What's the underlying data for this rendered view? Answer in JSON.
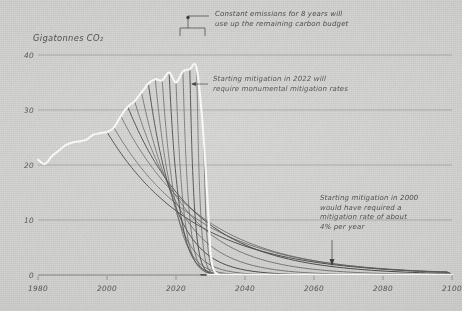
{
  "chart_data": {
    "type": "line",
    "title": "",
    "ylabel": "Gigatonnes CO₂",
    "xlabel": "",
    "xlim": [
      1980,
      2100
    ],
    "ylim": [
      0,
      44
    ],
    "grid": true,
    "legend_position": "none",
    "xticks": [
      1980,
      2000,
      2020,
      2040,
      2060,
      2080,
      2100
    ],
    "xtick_labels": [
      "1980",
      "2000",
      "2020",
      "2040",
      "2060",
      "2080",
      "2100"
    ],
    "yticks": [
      0,
      10,
      20,
      30,
      40
    ],
    "ytick_labels": [
      "0",
      "10",
      "20",
      "30",
      "40"
    ],
    "series": [
      {
        "name": "Historical emissions",
        "color": "#fdfdfb",
        "kind": "historical",
        "x": [
          1980,
          1982,
          1984,
          1986,
          1988,
          1990,
          1992,
          1994,
          1996,
          1998,
          2000,
          2002,
          2004,
          2006,
          2008,
          2010,
          2012,
          2014,
          2016,
          2018,
          2020,
          2022,
          2024,
          2026,
          2028,
          2030
        ],
        "values": [
          21.0,
          20.2,
          21.6,
          22.6,
          23.6,
          24.1,
          24.3,
          24.6,
          25.5,
          25.8,
          26.0,
          26.8,
          28.9,
          30.6,
          31.6,
          33.2,
          34.8,
          35.6,
          35.4,
          36.8,
          35.0,
          37.0,
          37.4,
          37.5,
          25.0,
          4.0
        ]
      },
      {
        "name": "Mitigation pathways fan",
        "color": "#5d5d5b",
        "kind": "fan",
        "start_years": [
          2000,
          2002,
          2004,
          2006,
          2008,
          2010,
          2012,
          2014,
          2016,
          2018,
          2020,
          2022,
          2024,
          2026,
          2028,
          2030
        ],
        "note": "Each curve branches from the historical emissions line at its start year and declines to near zero; later starts require steeper declines."
      }
    ],
    "annotations": [
      {
        "id": "constant-emissions",
        "lines": [
          "Constant emissions for 8 years will",
          "use up the remaining carbon budget"
        ],
        "target": "bracket spanning 2022–2030 at top of fan"
      },
      {
        "id": "mitigation-2022",
        "lines": [
          "Starting mitigation in 2022 will",
          "require monumental mitigation rates"
        ],
        "target": "steepest decline branch near 2030"
      },
      {
        "id": "mitigation-2000",
        "lines": [
          "Starting mitigation in 2000",
          "would have required a",
          "mitigation rate of about",
          "4% per year"
        ],
        "target": "shallowest decline branch near 2075"
      }
    ],
    "colors": {
      "background": "#d3d3d1",
      "grid": "#8f8f8d",
      "historical_line": "#fdfdfb",
      "fan_lines": "#5d5d5b",
      "text": "#4b4b44"
    }
  }
}
